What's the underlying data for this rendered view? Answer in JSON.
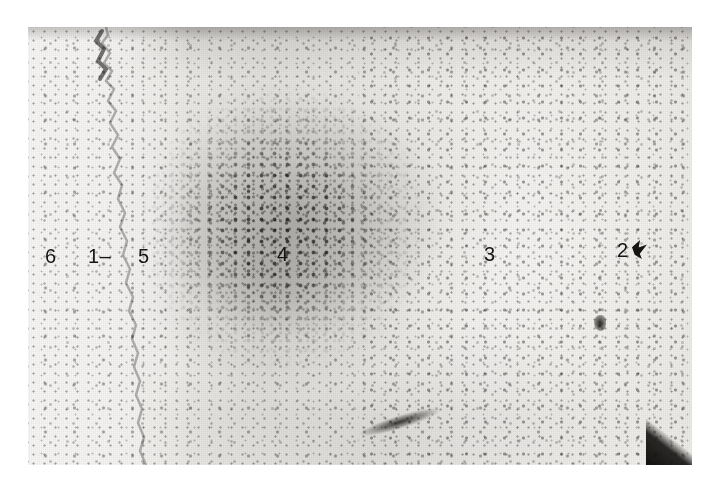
{
  "figure": {
    "kind": "histological-micrograph",
    "background_color": "#ffffff",
    "plate_tone": "#eceae7",
    "label_color": "#141414"
  },
  "plate": {
    "left": 28,
    "top": 27,
    "width": 664,
    "height": 438
  },
  "labels": [
    {
      "id": "label-6",
      "text": "6",
      "x": 45,
      "y": 246,
      "note": "outer unstained margin, far left"
    },
    {
      "id": "label-1",
      "text": "1",
      "x": 88,
      "y": 246,
      "dash": "–",
      "note": "tissue surface boundary, marked with a short dash pointer"
    },
    {
      "id": "label-5",
      "text": "5",
      "x": 138,
      "y": 246,
      "note": "pale band just inside the tissue edge"
    },
    {
      "id": "label-4",
      "text": "4",
      "x": 277,
      "y": 244,
      "note": "dense cell-rich cluster"
    },
    {
      "id": "label-3",
      "text": "3",
      "x": 484,
      "y": 244,
      "note": "paler cell-sparse field on the right"
    },
    {
      "id": "label-2",
      "text": "2",
      "x": 617,
      "y": 240,
      "note": "far right field, accompanied by a dark arrow-like mark"
    }
  ],
  "features": [
    {
      "id": "tissue-edge",
      "name": "wavy tissue boundary",
      "note": "undulating edge running from upper left down to lower centre-left"
    },
    {
      "id": "cell-cluster",
      "name": "dense nuclear cluster",
      "note": "dark stippled mass occupying the upper middle-left of the field"
    },
    {
      "id": "vessel-streak",
      "name": "dark elongated vessel",
      "note": "comet-shaped dark streak low in the centre of the field"
    },
    {
      "id": "blob-right",
      "name": "dark focal deposit",
      "note": "small dark blob in the right half"
    },
    {
      "id": "dark-wedge",
      "name": "dark corner artefact",
      "note": "black triangular wedge at the lower right corner of the plate"
    }
  ]
}
